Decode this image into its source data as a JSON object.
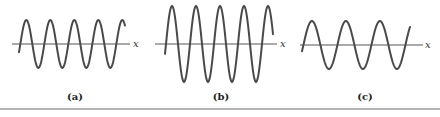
{
  "figure": {
    "panels": [
      {
        "id": "a",
        "label": "(a)",
        "axis_label": "x",
        "axis": {
          "x1": 12,
          "x2": 130,
          "y": 44
        },
        "wave": {
          "x_start": 19,
          "x_end": 125,
          "center_y": 44,
          "amplitude": 24,
          "period": 24,
          "phase_deg": -20
        },
        "axis_label_pos": {
          "x": 133,
          "y": 47
        },
        "label_pos": {
          "x": 75,
          "y": 100
        }
      },
      {
        "id": "b",
        "label": "(b)",
        "axis_label": "x",
        "axis": {
          "x1": 155,
          "x2": 277,
          "y": 44
        },
        "wave": {
          "x_start": 165,
          "x_end": 273,
          "center_y": 44,
          "amplitude": 38,
          "period": 24,
          "phase_deg": -15
        },
        "axis_label_pos": {
          "x": 280,
          "y": 47
        },
        "label_pos": {
          "x": 221,
          "y": 100
        }
      },
      {
        "id": "c",
        "label": "(c)",
        "axis_label": "x",
        "axis": {
          "x1": 300,
          "x2": 423,
          "y": 45
        },
        "wave": {
          "x_start": 302,
          "x_end": 410,
          "center_y": 45,
          "amplitude": 24,
          "period": 34,
          "phase_deg": -15
        },
        "axis_label_pos": {
          "x": 425,
          "y": 48
        },
        "label_pos": {
          "x": 365,
          "y": 100
        }
      }
    ],
    "rule": {
      "y": 108,
      "height": 2
    }
  }
}
